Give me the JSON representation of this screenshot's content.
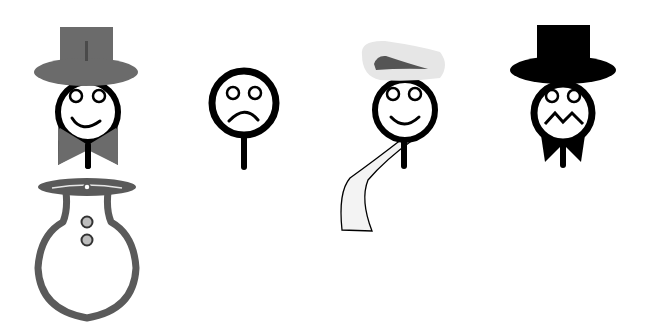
{
  "figures": [
    {
      "name": "gray-top-hat-smiling-figure",
      "hat_color": "#6b6b6b",
      "bowtie_color": "#6b6b6b",
      "mouth": "smile"
    },
    {
      "name": "frowning-figure",
      "mouth": "frown"
    },
    {
      "name": "beret-scarf-smiling-figure",
      "hat_color": "#e6e6e6",
      "hat_accent": "#555555",
      "scarf_color": "#f2f2f2",
      "mouth": "smile"
    },
    {
      "name": "black-top-hat-zigzag-figure",
      "hat_color": "#000000",
      "bowtie_color": "#000000",
      "mouth": "zigzag"
    },
    {
      "name": "flask-snowman-figure",
      "outline_color": "#5a5a5a",
      "button_color": "#bdbdbd",
      "button_count": 2
    }
  ],
  "colors": {
    "background": "#ffffff",
    "outline": "#000000",
    "gray": "#6b6b6b"
  }
}
